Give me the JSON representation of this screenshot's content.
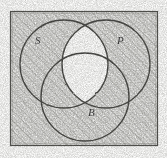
{
  "figure": {
    "kind": "venn-diagram",
    "title": "",
    "set_count": 3,
    "frame": {
      "shown": true,
      "stroke_color": "#555551",
      "x": 10,
      "y": 11,
      "width": 148,
      "height": 135
    },
    "background": {
      "paper_color": "#fdfdfc",
      "texture": "photocopy-grain",
      "hatch_color": "#6d6d68",
      "hatch_angle_deg": 45,
      "hatch_direction": "lower-left-to-upper-right"
    },
    "sets": [
      {
        "id": "S",
        "label": "S",
        "label_name": "set-label-s",
        "position": "upper-left",
        "cx": 64,
        "cy": 64,
        "r": 44,
        "stroke_color": "#4c4c48"
      },
      {
        "id": "P",
        "label": "P",
        "label_name": "set-label-p",
        "position": "upper-right",
        "cx": 106,
        "cy": 64,
        "r": 44,
        "stroke_color": "#4c4c48"
      },
      {
        "id": "B",
        "label": "B",
        "label_name": "set-label-b",
        "position": "lower-center",
        "cx": 85,
        "cy": 97,
        "r": 44,
        "stroke_color": "#4c4c48"
      }
    ],
    "regions": [
      {
        "id": "outside",
        "expression": "U \\ (S ∪ P ∪ B)",
        "shaded": true
      },
      {
        "id": "S-only",
        "expression": "S only",
        "shaded": true
      },
      {
        "id": "P-only",
        "expression": "P only",
        "shaded": true
      },
      {
        "id": "B-only",
        "expression": "B only",
        "shaded": true
      },
      {
        "id": "SP",
        "expression": "S ∩ P, not B",
        "shaded": false
      },
      {
        "id": "SB",
        "expression": "S ∩ B, not P",
        "shaded": true
      },
      {
        "id": "PB",
        "expression": "P ∩ B, not S",
        "shaded": true
      },
      {
        "id": "SPB",
        "expression": "S ∩ P ∩ B",
        "shaded": false
      }
    ],
    "shading_note": "Everything is hatched except the S ∩ P intersection (both the lens above B and the central S ∩ P ∩ B triangle)."
  }
}
